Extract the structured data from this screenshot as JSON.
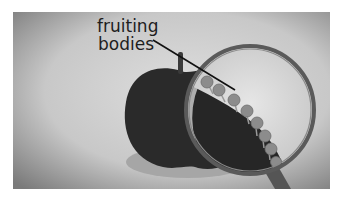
{
  "illustration": {
    "label": {
      "line1": "fruiting",
      "line2": "bodies"
    },
    "colors": {
      "background_light": "#d4d4d4",
      "background_dark": "#7e7e7e",
      "apple": "#2a2a2a",
      "apple_shadow": "#a8a8a8",
      "lens_interior": "#dcdcdc",
      "lens_ring": "#5e5e5e",
      "fruiting_body": "#8c8c8c",
      "pointer_line": "#111111"
    }
  }
}
